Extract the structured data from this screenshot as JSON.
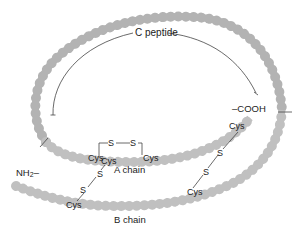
{
  "labels": {
    "c_peptide": "C peptide",
    "a_chain": "A chain",
    "b_chain": "B chain",
    "cooh": "–COOH",
    "nh2_main": "NH",
    "nh2_sub": "2",
    "nh2_dash": "–",
    "cys": "Cys",
    "s": "S"
  },
  "colors": {
    "bead": "#b3b3b3",
    "bead_light": "#c6c6c6",
    "line": "#444444",
    "text": "#222222",
    "background": "#ffffff"
  },
  "disulfide_bonds": [
    {
      "name": "intra-A-chain",
      "from": "Cys (A6)",
      "to": "Cys (A11)",
      "bridge": [
        "S",
        "S"
      ]
    },
    {
      "name": "A-B interchain 1",
      "from": "Cys (A7)",
      "to": "Cys (B7)",
      "bridge": [
        "S",
        "S"
      ]
    },
    {
      "name": "A-B interchain 2",
      "from": "Cys (A20)",
      "to": "Cys (B19)",
      "bridge": [
        "S",
        "S"
      ]
    }
  ]
}
